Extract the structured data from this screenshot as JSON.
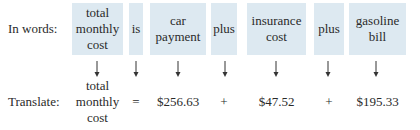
{
  "words_row": {
    "label": "In words:",
    "items": [
      {
        "text": "total\nmonthly\ncost",
        "x": 72,
        "w": 51
      },
      {
        "text": "is",
        "x": 129,
        "w": 14
      },
      {
        "text": "car\npayment",
        "x": 150,
        "w": 56
      },
      {
        "text": "plus",
        "x": 211,
        "w": 26
      },
      {
        "text": "insurance\ncost",
        "x": 247,
        "w": 59
      },
      {
        "text": "plus",
        "x": 314,
        "w": 30
      },
      {
        "text": "gasoline\nbill",
        "x": 349,
        "w": 57
      }
    ]
  },
  "arrow_icon": "down-arrow-icon",
  "translate_row": {
    "label": "Translate:",
    "items": [
      {
        "text": "total\nmonthly\ncost"
      },
      {
        "text": "="
      },
      {
        "text": "$256.63"
      },
      {
        "text": "+"
      },
      {
        "text": "$47.52"
      },
      {
        "text": "+"
      },
      {
        "text": "$195.33"
      }
    ]
  },
  "colors": {
    "box_fill": "#dde9f1",
    "text": "#2a2a2a"
  }
}
